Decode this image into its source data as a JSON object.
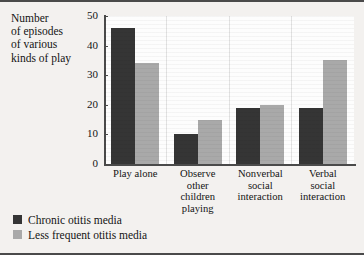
{
  "chart_data": {
    "type": "bar",
    "title": "",
    "ylabel": "Number\nof episodes\nof various\nkinds of play",
    "xlabel": "",
    "ylim": [
      0,
      50
    ],
    "yticks": [
      0,
      10,
      20,
      30,
      40,
      50
    ],
    "ytick_labels": [
      "0",
      "10",
      "20",
      "30",
      "40",
      "50"
    ],
    "grid": false,
    "legend_position": "below-left",
    "categories": [
      "Play alone",
      "Observe\nother\nchildren\nplaying",
      "Nonverbal\nsocial\ninteraction",
      "Verbal\nsocial\ninteraction"
    ],
    "series": [
      {
        "name": "Chronic otitis media",
        "color": "#353535",
        "values": [
          46,
          10,
          19,
          19
        ]
      },
      {
        "name": "Less frequent otitis media",
        "color": "#a9a9a9",
        "values": [
          34,
          15,
          20,
          35
        ]
      }
    ]
  },
  "legend": {
    "items": [
      {
        "label": "Chronic otitis media",
        "swatch": "dark"
      },
      {
        "label": "Less frequent otitis media",
        "swatch": "light"
      }
    ]
  }
}
